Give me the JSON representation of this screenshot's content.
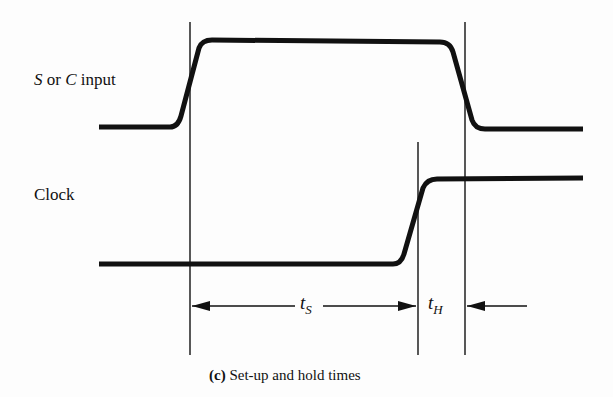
{
  "signals": {
    "input": {
      "label_prefix": "S",
      "label_or": " or ",
      "label_mid": "C",
      "label_suffix": " input"
    },
    "clock": {
      "label": "Clock"
    }
  },
  "timing": {
    "setup": {
      "symbol": "t",
      "subscript": "S"
    },
    "hold": {
      "symbol": "t",
      "subscript": "H"
    }
  },
  "caption": {
    "tag": "(c)",
    "text": " Set-up and hold times"
  },
  "colors": {
    "stroke": "#111111",
    "background": "#fdfdfd"
  }
}
